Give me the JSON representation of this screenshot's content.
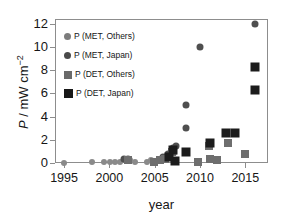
{
  "chart_data": {
    "type": "scatter",
    "title": "",
    "xlabel": "year",
    "ylabel": "P / mW cm-2",
    "ylabel_parts": {
      "symbol": "P",
      "sep": " / ",
      "unit": "mW cm",
      "exponent": "-2"
    },
    "xlim": [
      1994,
      2017.5
    ],
    "ylim": [
      0,
      12.4
    ],
    "xticks": [
      1995,
      2000,
      2005,
      2010,
      2015
    ],
    "yticks": [
      0,
      2,
      4,
      6,
      8,
      10,
      12
    ],
    "grid": false,
    "legend_position": "upper-left-inside",
    "legend": [
      {
        "label": "P (MET, Others)",
        "marker": "circle",
        "color": "#7c7c7c",
        "size": 7
      },
      {
        "label": "P (MET, Japan)",
        "marker": "circle",
        "color": "#4a4a4a",
        "size": 7
      },
      {
        "label": "P (DET, Others)",
        "marker": "square",
        "color": "#6a6a6a",
        "size": 8
      },
      {
        "label": "P (DET, Japan)",
        "marker": "square",
        "color": "#181818",
        "size": 9
      }
    ],
    "series": [
      {
        "name": "P (MET, Others)",
        "marker": "circle",
        "color": "#8a8a8a",
        "size": 6,
        "points": [
          [
            1995.0,
            0.02
          ],
          [
            1998.1,
            0.08
          ],
          [
            1999.4,
            0.06
          ],
          [
            2000.1,
            0.05
          ],
          [
            2000.6,
            0.05
          ],
          [
            2001.2,
            0.12
          ],
          [
            2001.9,
            0.3
          ],
          [
            2002.3,
            0.28
          ],
          [
            2002.8,
            0.1
          ],
          [
            2004.1,
            0.1
          ],
          [
            2004.6,
            0.22
          ],
          [
            2005.4,
            0.18
          ],
          [
            2006.2,
            0.45
          ],
          [
            2006.7,
            0.62
          ],
          [
            2007.1,
            0.9
          ]
        ]
      },
      {
        "name": "P (MET, Japan)",
        "marker": "circle",
        "color": "#4f4f4f",
        "size": 7,
        "points": [
          [
            2001.6,
            0.35
          ],
          [
            2002.1,
            0.32
          ],
          [
            2005.9,
            0.55
          ],
          [
            2006.5,
            0.75
          ],
          [
            2007.0,
            1.25
          ],
          [
            2007.3,
            1.45
          ],
          [
            2008.4,
            3.0
          ],
          [
            2008.5,
            5.0
          ],
          [
            2010.0,
            10.0
          ],
          [
            2016.1,
            12.0
          ]
        ]
      },
      {
        "name": "P (DET, Others)",
        "marker": "square",
        "color": "#6e6e6e",
        "size": 8,
        "points": [
          [
            2002.0,
            0.28
          ],
          [
            2004.9,
            0.12
          ],
          [
            2005.6,
            0.3
          ],
          [
            2006.1,
            0.35
          ],
          [
            2006.9,
            0.95
          ],
          [
            2009.8,
            0.05
          ],
          [
            2011.0,
            1.45
          ],
          [
            2011.1,
            0.32
          ],
          [
            2011.9,
            0.22
          ],
          [
            2013.1,
            1.75
          ],
          [
            2013.9,
            2.55
          ],
          [
            2015.0,
            0.75
          ]
        ]
      },
      {
        "name": "P (DET, Japan)",
        "marker": "square",
        "color": "#1c1c1c",
        "size": 9,
        "points": [
          [
            2006.6,
            0.55
          ],
          [
            2007.0,
            1.15
          ],
          [
            2007.2,
            0.15
          ],
          [
            2008.5,
            0.95
          ],
          [
            2011.1,
            1.7
          ],
          [
            2012.9,
            2.55
          ],
          [
            2013.9,
            2.55
          ],
          [
            2016.1,
            8.3
          ],
          [
            2016.1,
            6.3
          ]
        ]
      }
    ]
  }
}
